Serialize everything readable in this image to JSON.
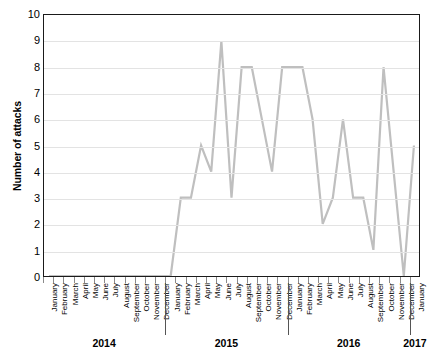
{
  "chart_data": {
    "type": "line",
    "title": "",
    "xlabel": "",
    "ylabel": "Number of attacks",
    "ylim": [
      0,
      10
    ],
    "ytick_labels": [
      "10",
      "9",
      "8",
      "7",
      "6",
      "5",
      "4",
      "3",
      "2",
      "1",
      "0"
    ],
    "yticks": [
      10,
      9,
      8,
      7,
      6,
      5,
      4,
      3,
      2,
      1,
      0
    ],
    "grid": true,
    "legend": false,
    "legend_position": "none",
    "line_color": "#bfbfbf",
    "frame_color": "#1a1a1a",
    "gridline_color": "#e3e3e3",
    "month_names": [
      "January",
      "February",
      "March",
      "April",
      "May",
      "June",
      "July",
      "August",
      "September",
      "October",
      "November",
      "December"
    ],
    "year_groups": [
      {
        "year": "2014",
        "months": 12
      },
      {
        "year": "2015",
        "months": 12
      },
      {
        "year": "2016",
        "months": 12
      },
      {
        "year": "2017",
        "months": 1
      }
    ],
    "categories": [
      "January 2014",
      "February 2014",
      "March 2014",
      "April 2014",
      "May 2014",
      "June 2014",
      "July 2014",
      "August 2014",
      "September 2014",
      "October 2014",
      "November 2014",
      "December 2014",
      "January 2015",
      "February 2015",
      "March 2015",
      "April 2015",
      "May 2015",
      "June 2015",
      "July 2015",
      "August 2015",
      "September 2015",
      "October 2015",
      "November 2015",
      "December 2015",
      "January 2016",
      "February 2016",
      "March 2016",
      "April 2016",
      "May 2016",
      "June 2016",
      "July 2016",
      "August 2016",
      "September 2016",
      "October 2016",
      "November 2016",
      "December 2016",
      "January 2017"
    ],
    "values": [
      0,
      0,
      0,
      0,
      0,
      0,
      0,
      0,
      0,
      0,
      0,
      0,
      0,
      3,
      3,
      5,
      4,
      9,
      3,
      8,
      8,
      6,
      4,
      8,
      8,
      8,
      6,
      2,
      3,
      6,
      3,
      3,
      1,
      8,
      4,
      0,
      5
    ]
  }
}
